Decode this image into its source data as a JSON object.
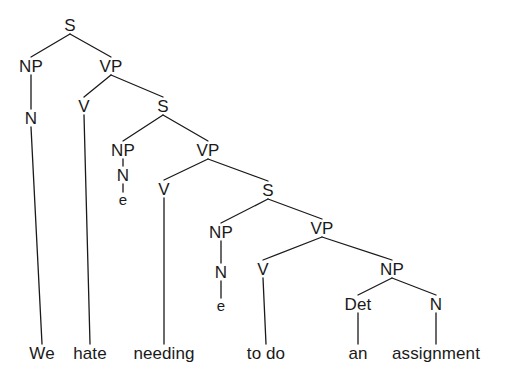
{
  "figure": {
    "kind": "syntax-tree",
    "sentence": "We hate needing to do an assignment",
    "ink_color": "#1a1a1a",
    "background_color": "#ffffff"
  },
  "nodes": [
    {
      "id": "s1",
      "label": "S",
      "x": 70,
      "y": 25,
      "kind": "phrasal"
    },
    {
      "id": "np1",
      "label": "NP",
      "x": 31,
      "y": 66,
      "kind": "phrasal"
    },
    {
      "id": "vp1",
      "label": "VP",
      "x": 111,
      "y": 66,
      "kind": "phrasal"
    },
    {
      "id": "n1",
      "label": "N",
      "x": 31,
      "y": 118,
      "kind": "lexical"
    },
    {
      "id": "v1",
      "label": "V",
      "x": 84,
      "y": 106,
      "kind": "lexical"
    },
    {
      "id": "s2",
      "label": "S",
      "x": 163,
      "y": 106,
      "kind": "phrasal"
    },
    {
      "id": "np2",
      "label": "NP",
      "x": 123,
      "y": 150,
      "kind": "phrasal"
    },
    {
      "id": "vp2",
      "label": "VP",
      "x": 208,
      "y": 150,
      "kind": "phrasal"
    },
    {
      "id": "n2",
      "label": "N",
      "x": 123,
      "y": 175,
      "kind": "lexical"
    },
    {
      "id": "e1",
      "label": "e",
      "x": 123,
      "y": 199,
      "kind": "empty"
    },
    {
      "id": "v2",
      "label": "V",
      "x": 164,
      "y": 189,
      "kind": "lexical"
    },
    {
      "id": "s3",
      "label": "S",
      "x": 268,
      "y": 190,
      "kind": "phrasal"
    },
    {
      "id": "np3",
      "label": "NP",
      "x": 221,
      "y": 232,
      "kind": "phrasal"
    },
    {
      "id": "vp3",
      "label": "VP",
      "x": 322,
      "y": 228,
      "kind": "phrasal"
    },
    {
      "id": "n3",
      "label": "N",
      "x": 221,
      "y": 272,
      "kind": "lexical"
    },
    {
      "id": "e2",
      "label": "e",
      "x": 221,
      "y": 305,
      "kind": "empty"
    },
    {
      "id": "v3",
      "label": "V",
      "x": 263,
      "y": 269,
      "kind": "lexical"
    },
    {
      "id": "np4",
      "label": "NP",
      "x": 392,
      "y": 269,
      "kind": "phrasal"
    },
    {
      "id": "det1",
      "label": "Det",
      "x": 358,
      "y": 304,
      "kind": "lexical"
    },
    {
      "id": "n4",
      "label": "N",
      "x": 436,
      "y": 304,
      "kind": "lexical"
    },
    {
      "id": "w1",
      "label": "We",
      "x": 42,
      "y": 353,
      "kind": "terminal"
    },
    {
      "id": "w2",
      "label": "hate",
      "x": 90,
      "y": 353,
      "kind": "terminal"
    },
    {
      "id": "w3",
      "label": "needing",
      "x": 164,
      "y": 353,
      "kind": "terminal"
    },
    {
      "id": "w4",
      "label": "to do",
      "x": 266,
      "y": 353,
      "kind": "terminal"
    },
    {
      "id": "w5",
      "label": "an",
      "x": 358,
      "y": 353,
      "kind": "terminal"
    },
    {
      "id": "w6",
      "label": "assignment",
      "x": 436,
      "y": 353,
      "kind": "terminal"
    }
  ],
  "edges": [
    {
      "from": "s1",
      "to": "np1"
    },
    {
      "from": "s1",
      "to": "vp1"
    },
    {
      "from": "np1",
      "to": "n1"
    },
    {
      "from": "vp1",
      "to": "v1"
    },
    {
      "from": "vp1",
      "to": "s2"
    },
    {
      "from": "n1",
      "to": "w1"
    },
    {
      "from": "v1",
      "to": "w2"
    },
    {
      "from": "s2",
      "to": "np2"
    },
    {
      "from": "s2",
      "to": "vp2"
    },
    {
      "from": "np2",
      "to": "n2"
    },
    {
      "from": "n2",
      "to": "e1"
    },
    {
      "from": "vp2",
      "to": "v2"
    },
    {
      "from": "vp2",
      "to": "s3"
    },
    {
      "from": "v2",
      "to": "w3"
    },
    {
      "from": "s3",
      "to": "np3"
    },
    {
      "from": "s3",
      "to": "vp3"
    },
    {
      "from": "np3",
      "to": "n3"
    },
    {
      "from": "n3",
      "to": "e2"
    },
    {
      "from": "vp3",
      "to": "v3"
    },
    {
      "from": "vp3",
      "to": "np4"
    },
    {
      "from": "v3",
      "to": "w4"
    },
    {
      "from": "np4",
      "to": "det1"
    },
    {
      "from": "np4",
      "to": "n4"
    },
    {
      "from": "det1",
      "to": "w5"
    },
    {
      "from": "n4",
      "to": "w6"
    }
  ]
}
